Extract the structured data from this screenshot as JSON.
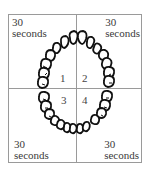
{
  "diagram": {
    "quadrants": [
      {
        "id": 1,
        "number": "1",
        "time_value": "30",
        "time_unit": "seconds",
        "position": "upper-left"
      },
      {
        "id": 2,
        "number": "2",
        "time_value": "30",
        "time_unit": "seconds",
        "position": "upper-right"
      },
      {
        "id": 3,
        "number": "3",
        "time_value": "30",
        "time_unit": "seconds",
        "position": "lower-left"
      },
      {
        "id": 4,
        "number": "4",
        "time_value": "30",
        "time_unit": "seconds",
        "position": "lower-right"
      }
    ],
    "colors": {
      "border": "#9a9a9a",
      "tooth_outline": "#111111",
      "text": "#3a3a3a"
    }
  }
}
